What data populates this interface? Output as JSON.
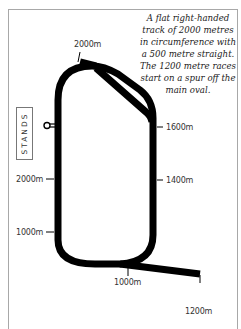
{
  "diagram": {
    "type": "racecourse-map",
    "description": "A flat right-handed track of 2000 metres in circumference with a 500 metre straight. The 1200 metre races start on a spur off the main oval.",
    "track_color": "#000000",
    "frame_color": "#a8a8a8"
  },
  "caption": {
    "text": "A flat right-handed track of 2000 metres in circumference with a 500 metre straight. The 1200 metre races start on a spur off the main oval."
  },
  "stands": {
    "label": "STANDS"
  },
  "markers": [
    {
      "id": "top-spur",
      "label": "2000m"
    },
    {
      "id": "right-1600",
      "label": "1600m"
    },
    {
      "id": "right-1400",
      "label": "1400m"
    },
    {
      "id": "left-2000",
      "label": "2000m"
    },
    {
      "id": "left-1000",
      "label": "1000m"
    },
    {
      "id": "bottom-1000",
      "label": "1000m"
    },
    {
      "id": "bottom-1200",
      "label": "1200m"
    }
  ],
  "winning_post": {
    "icon": "winning-post-icon"
  }
}
